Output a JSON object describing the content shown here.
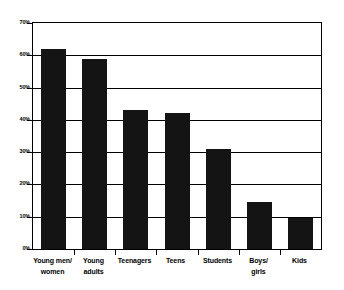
{
  "chart_data": {
    "type": "bar",
    "title": "",
    "subtitle": "",
    "xlabel": "",
    "ylabel": "",
    "categories": [
      "Young men/\nwomen",
      "Young\nadults",
      "Teenagers",
      "Teens",
      "Students",
      "Boys/\ngirls",
      "Kids"
    ],
    "category_lines": [
      [
        "Young men/",
        "women"
      ],
      [
        "Young",
        "adults"
      ],
      [
        "Teenagers"
      ],
      [
        "Teens"
      ],
      [
        "Students"
      ],
      [
        "Boys/",
        "girls"
      ],
      [
        "Kids"
      ]
    ],
    "values": [
      62,
      59,
      43,
      42,
      31,
      14.5,
      9.5
    ],
    "ylim": [
      0,
      70
    ],
    "ytick_step": 10,
    "ytick_labels": [
      "0%",
      "10%",
      "20%",
      "30%",
      "40%",
      "50%",
      "60%",
      "70%"
    ],
    "ytick_values": [
      0,
      10,
      20,
      30,
      40,
      50,
      60,
      70
    ],
    "grid": true,
    "grid_axis": "y",
    "legend": false,
    "legend_position": "none",
    "bar_color": "#141414",
    "grid_color": "#000000",
    "axis_color": "#000000",
    "background_color": "#ffffff"
  }
}
